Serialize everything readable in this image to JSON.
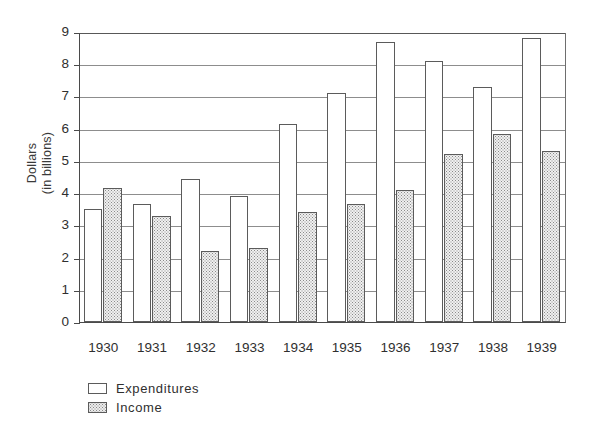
{
  "chart_data": {
    "type": "bar",
    "title": "",
    "subtitle": "",
    "xlabel": "",
    "ylabel": "Dollars\n(in billions)",
    "ylabel_line1": "Dollars",
    "ylabel_line2": "(in billions)",
    "categories": [
      "1930",
      "1931",
      "1932",
      "1933",
      "1934",
      "1935",
      "1936",
      "1937",
      "1938",
      "1939"
    ],
    "series": [
      {
        "name": "Expenditures",
        "fill": "white",
        "values": [
          3.5,
          3.65,
          4.45,
          3.9,
          6.15,
          7.1,
          8.7,
          8.1,
          7.3,
          8.8
        ]
      },
      {
        "name": "Income",
        "fill": "stipple",
        "values": [
          4.15,
          3.3,
          2.2,
          2.3,
          3.4,
          3.65,
          4.1,
          5.2,
          5.85,
          5.3
        ]
      }
    ],
    "ylim": [
      0,
      9
    ],
    "ytick_values": [
      0,
      1,
      2,
      3,
      4,
      5,
      6,
      7,
      8,
      9
    ],
    "ytick_labels": [
      "0",
      "1",
      "2",
      "3",
      "4",
      "5",
      "6",
      "7",
      "8",
      "9"
    ],
    "grid": true,
    "grid_axis": "y",
    "legend_position": "bottom-left",
    "legend": [
      "Expenditures",
      "Income"
    ],
    "annotations": []
  },
  "colors": {
    "axis": "#4a4a4a",
    "grid": "#8d8d8d",
    "bar_outline": "#5b5b5b",
    "expenditures_fill": "#ffffff",
    "income_fill": "#f0f0f0",
    "text": "#2f2f2f",
    "background": "#ffffff"
  }
}
